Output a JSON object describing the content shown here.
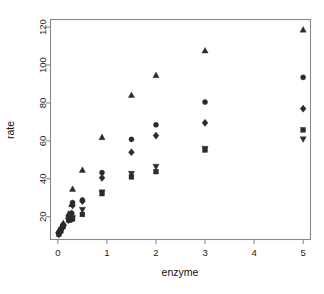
{
  "chart_data": {
    "type": "scatter",
    "title": "",
    "xlabel": "enzyme",
    "ylabel": "rate",
    "xlim": [
      -0.15,
      5.15
    ],
    "ylim": [
      8,
      124
    ],
    "grid": false,
    "legend": "none",
    "xticks": [
      0,
      1,
      2,
      3,
      4,
      5
    ],
    "xtick_labels": [
      "0",
      "1",
      "2",
      "3",
      "4",
      "5"
    ],
    "yticks": [
      20,
      40,
      60,
      80,
      100,
      120
    ],
    "ytick_labels": [
      "20",
      "40",
      "60",
      "80",
      "100",
      "120"
    ],
    "series": [
      {
        "name": "triangle-up",
        "marker": "triangle-up",
        "x": [
          0.02,
          0.06,
          0.11,
          0.22,
          0.28,
          0.3,
          0.5,
          0.9,
          1.5,
          2.0,
          3.0,
          5.0
        ],
        "y": [
          12.5,
          14.0,
          16.5,
          21.5,
          26.5,
          34.5,
          44.5,
          61.8,
          84.0,
          94.5,
          107.5,
          118.5
        ]
      },
      {
        "name": "circle",
        "marker": "circle",
        "x": [
          0.02,
          0.06,
          0.11,
          0.22,
          0.28,
          0.3,
          0.5,
          0.9,
          1.5,
          2.0,
          3.0,
          5.0
        ],
        "y": [
          11.8,
          13.5,
          15.8,
          19.8,
          22.0,
          27.5,
          28.8,
          43.3,
          60.8,
          68.5,
          80.5,
          93.5
        ]
      },
      {
        "name": "diamond",
        "marker": "diamond",
        "x": [
          0.02,
          0.06,
          0.11,
          0.22,
          0.28,
          0.3,
          0.5,
          0.9,
          1.5,
          2.0,
          3.0,
          5.0
        ],
        "y": [
          11.2,
          13.0,
          15.2,
          19.0,
          21.5,
          26.0,
          28.2,
          40.5,
          54.0,
          62.8,
          69.5,
          77.0
        ]
      },
      {
        "name": "square",
        "marker": "square",
        "x": [
          0.02,
          0.06,
          0.11,
          0.22,
          0.28,
          0.3,
          0.5,
          0.9,
          1.5,
          2.0,
          3.0,
          5.0
        ],
        "y": [
          10.8,
          12.5,
          14.8,
          18.2,
          18.8,
          19.0,
          21.2,
          32.2,
          41.0,
          43.8,
          55.2,
          65.8
        ]
      },
      {
        "name": "triangle-down",
        "marker": "triangle-down",
        "x": [
          0.02,
          0.06,
          0.11,
          0.22,
          0.28,
          0.3,
          0.5,
          0.9,
          1.5,
          2.0,
          3.0,
          5.0
        ],
        "y": [
          10.5,
          12.2,
          14.5,
          18.0,
          18.5,
          19.5,
          23.8,
          33.0,
          42.8,
          46.5,
          56.0,
          61.0
        ]
      }
    ]
  },
  "axes": {
    "x_title": "enzyme",
    "y_title": "rate"
  }
}
